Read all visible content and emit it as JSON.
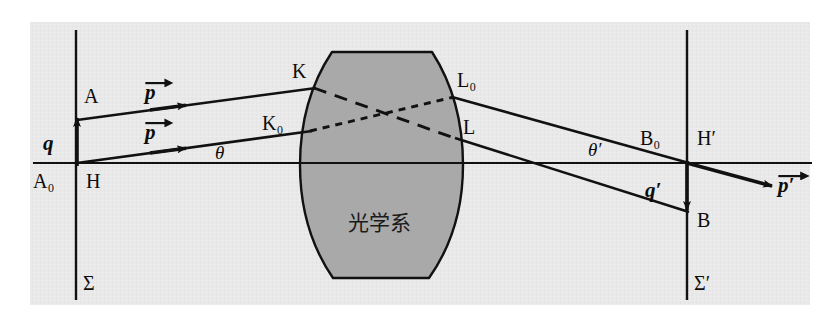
{
  "figure": {
    "type": "optics-ray-diagram",
    "title_text": "",
    "background_color": "#e8e8e8",
    "page_color": "#ffffff",
    "lens_fill_color": "#a8a8a8",
    "line_color": "#111111",
    "frame": {
      "x": 30,
      "y": 22,
      "width": 780,
      "height": 283
    },
    "axis": {
      "y": 163,
      "x_start": 33,
      "x_end": 812,
      "label": "optical-axis"
    },
    "planes": [
      {
        "name": "object-plane",
        "label": "Σ",
        "x": 76,
        "y_top": 30,
        "y_bottom": 300,
        "label_x": 84,
        "label_y": 288
      },
      {
        "name": "image-plane",
        "label": "Σ′",
        "x": 687,
        "y_top": 30,
        "y_bottom": 300,
        "label_x": 695,
        "label_y": 288
      }
    ],
    "lens": {
      "label": "光学系",
      "label_x": 385,
      "label_y": 230,
      "top_y": 52,
      "bottom_y": 278,
      "top_left_x": 332,
      "top_right_x": 432,
      "bottom_left_x": 333,
      "bottom_right_x": 429,
      "left_bulge_x": 300,
      "right_bulge_x": 463
    },
    "points": [
      {
        "name": "A",
        "label": "A",
        "x": 77,
        "y": 120,
        "label_x": 84,
        "label_y": 100
      },
      {
        "name": "A0",
        "label": "A₀",
        "x": 77,
        "y": 163,
        "label_x": 34,
        "label_y": 184
      },
      {
        "name": "H",
        "label": "H",
        "x": 77,
        "y": 163,
        "label_x": 86,
        "label_y": 184
      },
      {
        "name": "K",
        "label": "K",
        "x": 314,
        "y": 88,
        "label_x": 296,
        "label_y": 74
      },
      {
        "name": "K0",
        "label": "K₀",
        "x": 310,
        "y": 131,
        "label_x": 270,
        "label_y": 127
      },
      {
        "name": "L0",
        "label": "L₀",
        "x": 452,
        "y": 97,
        "label_x": 460,
        "label_y": 85
      },
      {
        "name": "L",
        "label": "L",
        "x": 455,
        "y": 138,
        "label_x": 466,
        "label_y": 130
      },
      {
        "name": "B0",
        "label": "B₀",
        "x": 687,
        "y": 163,
        "label_x": 645,
        "label_y": 142
      },
      {
        "name": "Hp",
        "label": "H′",
        "x": 687,
        "y": 163,
        "label_x": 698,
        "label_y": 142
      },
      {
        "name": "B",
        "label": "B",
        "x": 687,
        "y": 212,
        "label_x": 697,
        "label_y": 222
      }
    ],
    "vectors": [
      {
        "name": "q",
        "label": "q",
        "from": [
          77,
          163
        ],
        "to": [
          77,
          120
        ],
        "label_x": 48,
        "label_y": 146
      },
      {
        "name": "qp",
        "label": "q′",
        "from": [
          687,
          163
        ],
        "to": [
          687,
          212
        ],
        "label_x": 650,
        "label_y": 192
      },
      {
        "name": "p-upper",
        "label": "p",
        "arrow_on_label": true,
        "label_x": 152,
        "label_y": 98
      },
      {
        "name": "p-lower",
        "label": "p",
        "arrow_on_label": true,
        "label_x": 152,
        "label_y": 138
      },
      {
        "name": "p-prime",
        "label": "p′",
        "arrow_on_label": true,
        "label_x": 782,
        "label_y": 190
      }
    ],
    "angles": [
      {
        "name": "theta",
        "label": "θ",
        "label_x": 222,
        "label_y": 156
      },
      {
        "name": "theta-prime",
        "label": "θ′",
        "label_x": 596,
        "label_y": 153
      }
    ],
    "rays": {
      "incoming_upper": {
        "from": [
          77,
          120
        ],
        "to": [
          314,
          88
        ],
        "style": "solid"
      },
      "incoming_lower": {
        "from": [
          77,
          163
        ],
        "to": [
          310,
          131
        ],
        "style": "solid"
      },
      "internal_K_to_L": {
        "from": [
          314,
          88
        ],
        "to": [
          455,
          138
        ],
        "style": "dashed-long"
      },
      "internal_K0_to_L0": {
        "from": [
          310,
          131
        ],
        "to": [
          452,
          97
        ],
        "style": "dashed-short"
      },
      "outgoing_from_L0": {
        "from": [
          452,
          97
        ],
        "to": [
          687,
          163
        ],
        "style": "solid"
      },
      "outgoing_from_L": {
        "from": [
          455,
          138
        ],
        "to": [
          687,
          212
        ],
        "style": "solid"
      },
      "exit_p_prime": {
        "from": [
          687,
          163
        ],
        "to": [
          775,
          187
        ],
        "style": "solid-arrow"
      }
    }
  }
}
